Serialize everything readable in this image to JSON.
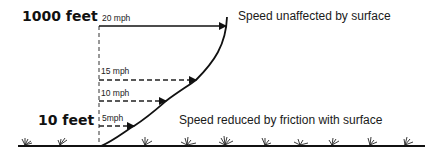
{
  "diagram": {
    "altitudes": {
      "top": "1000 feet",
      "bottom": "10 feet"
    },
    "speed_arrows": [
      {
        "label": "20 mph",
        "speed_mph": 20
      },
      {
        "label": "15 mph",
        "speed_mph": 15
      },
      {
        "label": "10 mph",
        "speed_mph": 10
      },
      {
        "label": "5mph",
        "speed_mph": 5
      }
    ],
    "annotations": {
      "upper": "Speed unaffected by surface",
      "lower": "Speed reduced by friction with surface"
    },
    "colors": {
      "ink": "#111111",
      "background": "#ffffff"
    }
  }
}
